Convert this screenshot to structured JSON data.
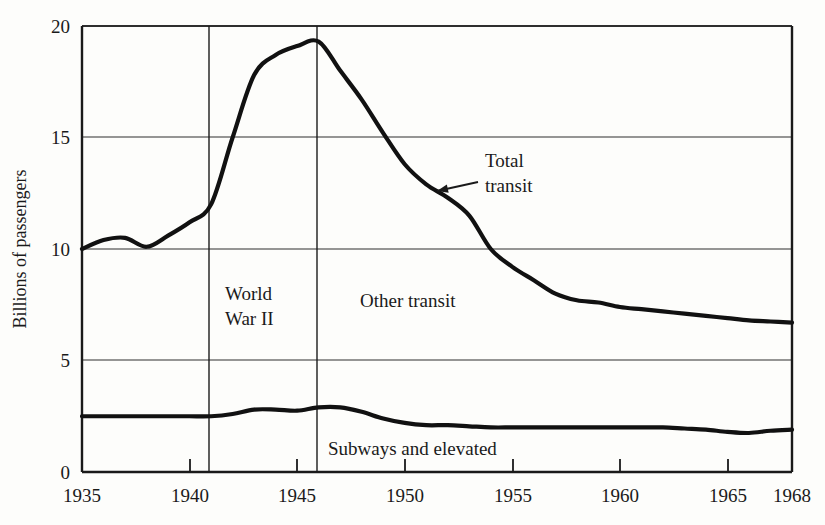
{
  "chart_data": {
    "type": "line",
    "title": "",
    "subtitle": "",
    "xlabel": "",
    "ylabel": "Billions of passengers",
    "xlim": [
      1935,
      1968
    ],
    "ylim": [
      0,
      20
    ],
    "grid": true,
    "legend_position": "inline-annotations",
    "x_ticks": [
      1935,
      1940,
      1945,
      1950,
      1955,
      1960,
      1965,
      1968
    ],
    "x_tick_labels": [
      "1935",
      "1940",
      "1945",
      "1950",
      "1955",
      "1960",
      "1965",
      "1968"
    ],
    "y_ticks": [
      0,
      5,
      10,
      15,
      20
    ],
    "y_tick_labels": [
      "0",
      "5",
      "10",
      "15",
      "20"
    ],
    "x": [
      1935,
      1936,
      1937,
      1938,
      1939,
      1940,
      1941,
      1942,
      1943,
      1944,
      1945,
      1946,
      1947,
      1948,
      1949,
      1950,
      1951,
      1952,
      1953,
      1954,
      1955,
      1956,
      1957,
      1958,
      1959,
      1960,
      1961,
      1962,
      1963,
      1964,
      1965,
      1966,
      1967,
      1968
    ],
    "series": [
      {
        "name": "Total transit",
        "values": [
          10.0,
          10.4,
          10.5,
          10.1,
          10.6,
          11.2,
          12.0,
          15.0,
          17.8,
          18.7,
          19.1,
          19.3,
          18.0,
          16.7,
          15.2,
          13.8,
          12.9,
          12.3,
          11.5,
          10.0,
          9.2,
          8.6,
          8.0,
          7.7,
          7.6,
          7.4,
          7.3,
          7.2,
          7.1,
          7.0,
          6.9,
          6.8,
          6.75,
          6.7
        ]
      },
      {
        "name": "Subways and elevated",
        "values": [
          2.5,
          2.5,
          2.5,
          2.5,
          2.5,
          2.5,
          2.5,
          2.6,
          2.8,
          2.8,
          2.75,
          2.9,
          2.9,
          2.7,
          2.4,
          2.2,
          2.1,
          2.1,
          2.05,
          2.0,
          2.0,
          2.0,
          2.0,
          2.0,
          2.0,
          2.0,
          2.0,
          2.0,
          1.95,
          1.9,
          1.8,
          1.75,
          1.85,
          1.9
        ]
      }
    ],
    "annotations": [
      {
        "name": "total-transit",
        "text_lines": [
          "Total",
          "transit"
        ],
        "text_x": 485,
        "text_y": 167,
        "arrow_from_x": 478,
        "arrow_from_y": 182,
        "arrow_to_x": 437,
        "arrow_to_y": 191
      },
      {
        "name": "other-transit",
        "text_lines": [
          "Other transit"
        ],
        "text_x": 360,
        "text_y": 307
      },
      {
        "name": "subways-and-elevated",
        "text_lines": [
          "Subways and elevated"
        ],
        "text_x": 328,
        "text_y": 455
      },
      {
        "name": "world-war-ii",
        "text_lines": [
          "World",
          "War II"
        ],
        "text_x": 225,
        "text_y": 300,
        "span_start_x": 1940.9,
        "span_end_x": 1945.9
      }
    ]
  },
  "axis": {
    "y_title": "Billions of passengers",
    "y_labels": [
      "20",
      "15",
      "10",
      "5",
      "0"
    ],
    "x_labels": [
      "1935",
      "1940",
      "1945",
      "1950",
      "1955",
      "1960",
      "1965",
      "1968"
    ]
  },
  "labels": {
    "total_transit_line1": "Total",
    "total_transit_line2": "transit",
    "other_transit": "Other transit",
    "subways_and_elevated": "Subways and elevated",
    "world_war_line1": "World",
    "world_war_line2": "War II"
  },
  "colors": {
    "background": "#fdfdfb",
    "ink": "#1a1a1a",
    "gridline": "#3a3a3a",
    "curve": "#111111"
  }
}
